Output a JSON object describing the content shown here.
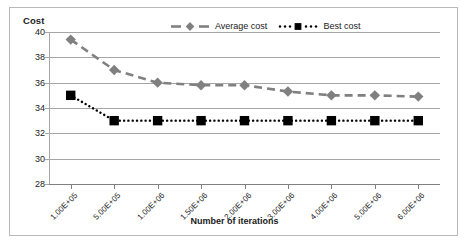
{
  "chart_data": {
    "type": "line",
    "title": "",
    "xlabel": "Number of iterations",
    "ylabel": "Cost",
    "categories": [
      "1.00E+05",
      "5.00E+05",
      "1.00E+06",
      "1.50E+06",
      "2.00E+06",
      "3.00E+06",
      "4.00E+06",
      "5.00E+06",
      "6.00E+06"
    ],
    "series": [
      {
        "name": "Average cost",
        "color": "#808080",
        "marker": "diamond",
        "linestyle": "dashed",
        "values": [
          39.4,
          37.0,
          36.0,
          35.8,
          35.8,
          35.3,
          35.0,
          35.0,
          34.9
        ]
      },
      {
        "name": "Best cost",
        "color": "#000000",
        "marker": "square",
        "linestyle": "dotted",
        "values": [
          35.0,
          33.0,
          33.0,
          33.0,
          33.0,
          33.0,
          33.0,
          33.0,
          33.0
        ]
      }
    ],
    "yticks": [
      40,
      38,
      36,
      34,
      32,
      30,
      28
    ],
    "ylim": [
      28,
      40
    ],
    "grid": "horizontal",
    "legend_position": "top-center"
  },
  "legend": {
    "items": [
      {
        "label": "Average cost"
      },
      {
        "label": "Best cost"
      }
    ]
  },
  "axes": {
    "y_title": "Cost",
    "x_title": "Number of iterations"
  }
}
